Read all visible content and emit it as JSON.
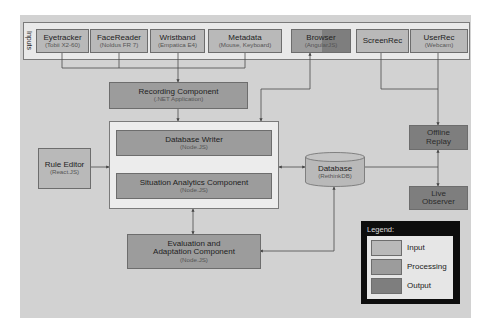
{
  "colors": {
    "background": "#d2d2d2",
    "input": "#b9b9b9",
    "processing": "#9c9c9c",
    "output": "#7e7e7e",
    "legend_frame": "#0d0d0d"
  },
  "inputs": {
    "label": "Inputs",
    "items": [
      {
        "title": "Eyetracker",
        "subtitle": "(Tobii X2-60)",
        "type": "input"
      },
      {
        "title": "FaceReader",
        "subtitle": "(Noldus FR 7)",
        "type": "input"
      },
      {
        "title": "Wristband",
        "subtitle": "(Empatica E4)",
        "type": "input"
      },
      {
        "title": "Metadata",
        "subtitle": "(Mouse, Keyboard)",
        "type": "input"
      },
      {
        "title": "Browser",
        "subtitle": "(AngularJS)",
        "type": "processing/output"
      },
      {
        "title": "ScreenRec",
        "subtitle": "",
        "type": "input"
      },
      {
        "title": "UserRec",
        "subtitle": "(Webcam)",
        "type": "input"
      }
    ]
  },
  "components": {
    "recording": {
      "title": "Recording Component",
      "subtitle": "(.NET Application)"
    },
    "db_writer": {
      "title": "Database Writer",
      "subtitle": "(Node.JS)"
    },
    "situation_analytics": {
      "title": "Situation Analytics Component",
      "subtitle": "(Node.JS)"
    },
    "rule_editor": {
      "title": "Rule Editor",
      "subtitle": "(React.JS)"
    },
    "database": {
      "title": "Database",
      "subtitle": "(RethinkDB)"
    },
    "evaluation": {
      "title_line1": "Evaluation and",
      "title_line2": "Adaptation Component",
      "subtitle": "(Node.JS)"
    },
    "offline_replay": {
      "title_line1": "Offline",
      "title_line2": "Replay"
    },
    "live_observer": {
      "title_line1": "Live",
      "title_line2": "Observer"
    }
  },
  "legend": {
    "title": "Legend:",
    "items": [
      {
        "label": "Input",
        "color": "#b9b9b9"
      },
      {
        "label": "Processing",
        "color": "#9c9c9c"
      },
      {
        "label": "Output",
        "color": "#7e7e7e"
      }
    ]
  }
}
